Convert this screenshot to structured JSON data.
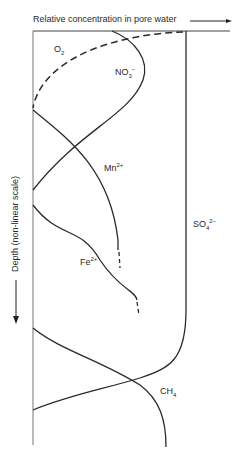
{
  "diagram": {
    "x_axis_label": "Relative concentration in pore water",
    "y_axis_label": "Depth (non-linear scale)",
    "species": [
      {
        "name": "O2",
        "main": "O",
        "sub": "2",
        "sup": "",
        "line": "dashed"
      },
      {
        "name": "NO3-",
        "main": "NO",
        "sub": "3",
        "sup": "−",
        "line": "solid"
      },
      {
        "name": "Mn2+",
        "main": "Mn",
        "sub": "",
        "sup": "2+",
        "line": "solid"
      },
      {
        "name": "Fe2+",
        "main": "Fe",
        "sub": "",
        "sup": "2+",
        "line": "solid"
      },
      {
        "name": "SO42-",
        "main": "SO",
        "sub": "4",
        "sup": "2−",
        "line": "solid"
      },
      {
        "name": "CH4",
        "main": "CH",
        "sub": "4",
        "sup": "",
        "line": "solid"
      }
    ],
    "colors": {
      "line": "#2a2a2a",
      "axis": "#555555",
      "background": "#ffffff"
    }
  }
}
